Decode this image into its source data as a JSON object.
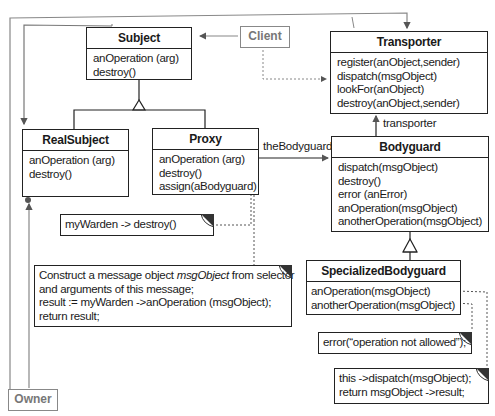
{
  "diagram": {
    "classes": {
      "subject": {
        "name": "Subject",
        "operations": [
          "anOperation (arg)",
          "destroy()"
        ]
      },
      "real_subject": {
        "name": "RealSubject",
        "operations": [
          "anOperation (arg)",
          "destroy()"
        ]
      },
      "proxy": {
        "name": "Proxy",
        "operations": [
          "anOperation (arg)",
          "destroy()",
          "assign(aBodyguard)"
        ]
      },
      "transporter": {
        "name": "Transporter",
        "operations": [
          "register(anObject,sender)",
          "dispatch(msgObject)",
          "lookFor(anObject)",
          "destroy(anObject,sender)"
        ]
      },
      "bodyguard": {
        "name": "Bodyguard",
        "operations": [
          "dispatch(msgObject)",
          "destroy()",
          "error (anError)",
          "anOperation(msgObject)",
          "anotherOperation(msgObject)"
        ]
      },
      "specialized_bodyguard": {
        "name": "SpecializedBodyguard",
        "operations": [
          "anOperation(msgObject)",
          "anotherOperation(msgObject)"
        ]
      }
    },
    "actors": {
      "client": "Client",
      "owner": "Owner"
    },
    "associations": {
      "the_bodyguard": "theBodyguard",
      "transporter": "transporter"
    },
    "notes": {
      "proxy_destroy": "myWarden -> destroy()",
      "proxy_operation": {
        "line1_prefix": "Construct a message object ",
        "line1_italic": "msgObject",
        "line1_suffix": " from selector",
        "line2": "and arguments of this message;",
        "line3": "result := myWarden ->anOperation (msgObject);",
        "line4": "return result;"
      },
      "specialized_another": "error(“operation not allowed”);",
      "specialized_operation": [
        "this ->dispatch(msgObject);",
        "return msgObject ->result;"
      ]
    },
    "colors": {
      "line": "#222222",
      "actor_gray": "#888888",
      "note_corner": "#333333"
    }
  }
}
